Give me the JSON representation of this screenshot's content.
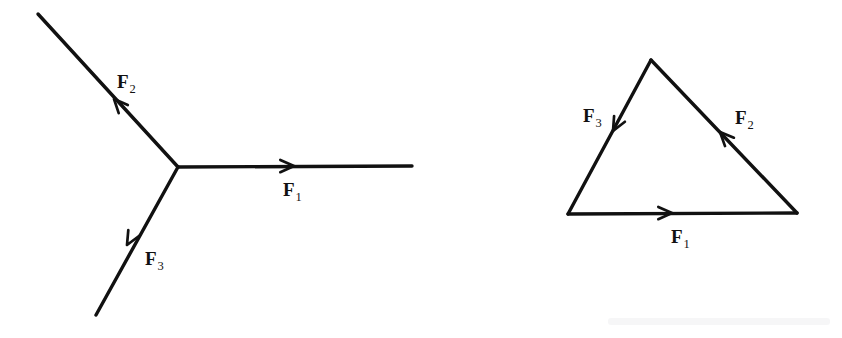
{
  "figure": {
    "background_color": "#ffffff",
    "ink_color": "#111111",
    "panels": [
      {
        "name": "concurrent-forces-panel",
        "description": "Three concurrent force vectors meeting at a common point",
        "junction": {
          "x": 178,
          "y": 167
        },
        "vectors": [
          {
            "id": "F1",
            "label": "F",
            "subscript": "1",
            "label_x": 283,
            "label_y": 196,
            "from": {
              "x": 178,
              "y": 167
            },
            "to": {
              "x": 412,
              "y": 166
            },
            "arrow_at": {
              "x": 294,
              "y": 166
            },
            "arrow_direction": "right",
            "angle_deg": 0
          },
          {
            "id": "F2",
            "label": "F",
            "subscript": "2",
            "label_x": 117,
            "label_y": 88,
            "from": {
              "x": 178,
              "y": 167
            },
            "to": {
              "x": 38,
              "y": 14
            },
            "arrow_at": {
              "x": 114,
              "y": 99
            },
            "arrow_direction": "up-left",
            "angle_deg": 132
          },
          {
            "id": "F3",
            "label": "F",
            "subscript": "3",
            "label_x": 145,
            "label_y": 265,
            "from": {
              "x": 178,
              "y": 167
            },
            "to": {
              "x": 96,
              "y": 315
            },
            "arrow_at": {
              "x": 127,
              "y": 245
            },
            "arrow_direction": "down-left",
            "angle_deg": 241
          }
        ]
      },
      {
        "name": "force-triangle-panel",
        "description": "The same three forces drawn head-to-tail forming a closed triangle",
        "vertices": {
          "apex": {
            "x": 651,
            "y": 60
          },
          "bottom_left": {
            "x": 568,
            "y": 214
          },
          "bottom_right": {
            "x": 797,
            "y": 213
          }
        },
        "vectors": [
          {
            "id": "F1",
            "label": "F",
            "subscript": "1",
            "label_x": 671,
            "label_y": 243,
            "from": {
              "x": 568,
              "y": 214
            },
            "to": {
              "x": 797,
              "y": 213
            },
            "arrow_at": {
              "x": 672,
              "y": 213
            },
            "arrow_direction": "right",
            "edge": "base"
          },
          {
            "id": "F2",
            "label": "F",
            "subscript": "2",
            "label_x": 735,
            "label_y": 124,
            "from": {
              "x": 797,
              "y": 213
            },
            "to": {
              "x": 651,
              "y": 60
            },
            "arrow_at": {
              "x": 720,
              "y": 132
            },
            "arrow_direction": "up-left",
            "edge": "right"
          },
          {
            "id": "F3",
            "label": "F",
            "subscript": "3",
            "label_x": 583,
            "label_y": 122,
            "from": {
              "x": 651,
              "y": 60
            },
            "to": {
              "x": 568,
              "y": 214
            },
            "arrow_at": {
              "x": 613,
              "y": 131
            },
            "arrow_direction": "down-left",
            "edge": "left"
          }
        ]
      }
    ]
  }
}
